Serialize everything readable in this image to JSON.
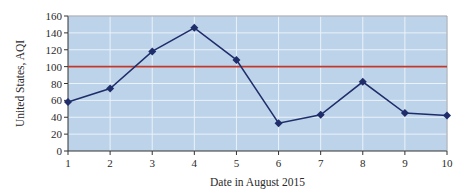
{
  "chart_data": {
    "type": "line",
    "title": "",
    "xlabel": "Date in August 2015",
    "ylabel": "United States, AQI",
    "categories": [
      "1",
      "2",
      "3",
      "4",
      "5",
      "6",
      "7",
      "8",
      "9",
      "10"
    ],
    "x": [
      1,
      2,
      3,
      4,
      5,
      6,
      7,
      8,
      9,
      10
    ],
    "series": [
      {
        "name": "AQI",
        "values": [
          58,
          74,
          118,
          146,
          108,
          33,
          43,
          82,
          45,
          42
        ],
        "color": "#1f2d6b",
        "marker": "diamond"
      }
    ],
    "reference_lines": [
      {
        "y": 100,
        "color": "#c0392b",
        "label": ""
      }
    ],
    "xlim": [
      1,
      10
    ],
    "ylim": [
      0,
      160
    ],
    "yticks": [
      0,
      20,
      40,
      60,
      80,
      100,
      120,
      140,
      160
    ],
    "xticks": [
      1,
      2,
      3,
      4,
      5,
      6,
      7,
      8,
      9,
      10
    ],
    "grid": true,
    "legend": null,
    "colors": {
      "plot_background": "#bcd3ea",
      "grid": "#eaf2fa",
      "line": "#1f2d6b",
      "reference": "#c0392b",
      "axis": "#333333"
    }
  }
}
